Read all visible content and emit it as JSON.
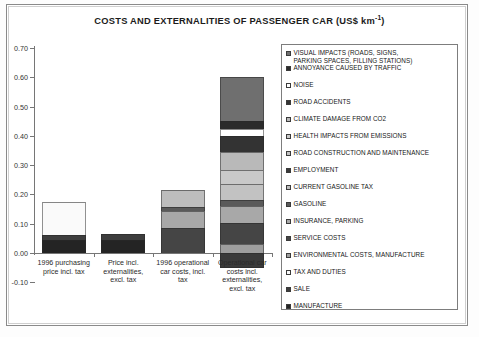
{
  "chart": {
    "title_main": "COSTS AND EXTERNALITIES OF PASSENGER CAR (US$ km",
    "title_sup": "-1",
    "title_tail": ")"
  },
  "axis": {
    "y_ticks": [
      "0.70",
      "0.60",
      "0.50",
      "0.40",
      "0.30",
      "0.20",
      "0.10",
      "0.00",
      "-0.10"
    ]
  },
  "legend": {
    "items": [
      {
        "label": "VISUAL IMPACTS (ROADS, SIGNS,\nPARKING SPACES, FILLING STATIONS)",
        "color": "#6f6f6f"
      },
      {
        "label": "ANNOYANCE CAUSED BY TRAFFIC",
        "color": "#2b2b2b"
      },
      {
        "label": "NOISE",
        "color": "#ffffff"
      },
      {
        "label": "ROAD ACCIDENTS",
        "color": "#333333"
      },
      {
        "label": "CLIMATE DAMAGE FROM CO2",
        "color": "#b9b9b9"
      },
      {
        "label": "HEALTH IMPACTS FROM EMISSIONS",
        "color": "#c9c9c9"
      },
      {
        "label": "ROAD CONSTRUCTION AND MAINTENANCE",
        "color": "#c2c2c2"
      },
      {
        "label": "EMPLOYMENT",
        "color": "#3a3a3a"
      },
      {
        "label": "CURRENT GASOLINE TAX",
        "color": "#bdbdbd"
      },
      {
        "label": "GASOLINE",
        "color": "#5a5a5a"
      },
      {
        "label": "INSURANCE, PARKING",
        "color": "#a8a8a8"
      },
      {
        "label": "SERVICE COSTS",
        "color": "#454545"
      },
      {
        "label": "ENVIRONMENTAL COSTS, MANUFACTURE",
        "color": "#9e9e9e"
      },
      {
        "label": "TAX AND DUTIES",
        "color": "#fafafa"
      },
      {
        "label": "SALE",
        "color": "#3d3d3d"
      },
      {
        "label": "MANUFACTURE",
        "color": "#242424"
      }
    ]
  },
  "chart_data": {
    "type": "bar",
    "subtype": "stacked",
    "title": "COSTS AND EXTERNALITIES OF PASSENGER CAR (US$ km-1)",
    "xlabel": "",
    "ylabel": "",
    "ylim": [
      -0.1,
      0.7
    ],
    "ytick_step": 0.1,
    "grid": false,
    "legend_position": "right",
    "categories": [
      "1996 purchasing price incl. tax",
      "Price incl. externalities, excl. tax",
      "1996 operational car costs, incl. tax",
      "Operational car costs incl. externalities, excl. tax"
    ],
    "series": [
      {
        "name": "MANUFACTURE",
        "color": "#242424",
        "values": [
          0.045,
          0.045,
          0,
          0
        ]
      },
      {
        "name": "SALE",
        "color": "#3d3d3d",
        "values": [
          0.018,
          0.02,
          0,
          0
        ]
      },
      {
        "name": "TAX AND DUTIES",
        "color": "#fafafa",
        "values": [
          0.112,
          0,
          0,
          0
        ]
      },
      {
        "name": "ENVIRONMENTAL COSTS, MANUFACTURE",
        "color": "#9e9e9e",
        "values": [
          0,
          0,
          0,
          0.03
        ]
      },
      {
        "name": "SERVICE COSTS",
        "color": "#454545",
        "values": [
          0,
          0,
          0.085,
          0.072
        ]
      },
      {
        "name": "INSURANCE, PARKING",
        "color": "#a8a8a8",
        "values": [
          0,
          0,
          0.06,
          0.06
        ]
      },
      {
        "name": "GASOLINE",
        "color": "#5a5a5a",
        "values": [
          0,
          0,
          0.012,
          0.018
        ]
      },
      {
        "name": "CURRENT GASOLINE TAX",
        "color": "#bdbdbd",
        "values": [
          0,
          0,
          0.058,
          0
        ]
      },
      {
        "name": "EMPLOYMENT",
        "color": "#3a3a3a",
        "values": [
          0,
          0,
          0,
          -0.05
        ]
      },
      {
        "name": "ROAD CONSTRUCTION AND MAINTENANCE",
        "color": "#c2c2c2",
        "values": [
          0,
          0,
          0,
          0.055
        ]
      },
      {
        "name": "HEALTH IMPACTS FROM EMISSIONS",
        "color": "#c9c9c9",
        "values": [
          0,
          0,
          0,
          0.048
        ]
      },
      {
        "name": "CLIMATE DAMAGE FROM CO2",
        "color": "#b9b9b9",
        "values": [
          0,
          0,
          0,
          0.062
        ]
      },
      {
        "name": "ROAD ACCIDENTS",
        "color": "#333333",
        "values": [
          0,
          0,
          0,
          0.055
        ]
      },
      {
        "name": "NOISE",
        "color": "#ffffff",
        "values": [
          0,
          0,
          0,
          0.022
        ]
      },
      {
        "name": "ANNOYANCE CAUSED BY TRAFFIC",
        "color": "#2b2b2b",
        "values": [
          0,
          0,
          0,
          0.03
        ]
      },
      {
        "name": "VISUAL IMPACTS (ROADS, SIGNS, PARKING SPACES, FILLING STATIONS)",
        "color": "#6f6f6f",
        "values": [
          0,
          0,
          0,
          0.148
        ]
      }
    ],
    "totals_positive": [
      0.175,
      0.065,
      0.215,
      0.6
    ],
    "totals_negative": [
      0,
      0,
      0,
      -0.05
    ]
  }
}
